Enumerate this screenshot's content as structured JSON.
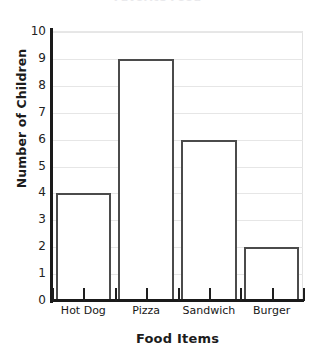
{
  "chart_data": {
    "type": "bar",
    "title": "Favorite Food",
    "xlabel": "Food Items",
    "ylabel": "Number of Children",
    "categories": [
      "Hot Dog",
      "Pizza",
      "Sandwich",
      "Burger"
    ],
    "values": [
      4,
      9,
      6,
      2
    ],
    "ylim": [
      0,
      10
    ],
    "ytick_labels": [
      "10",
      "9",
      "8",
      "7",
      "6",
      "5",
      "4",
      "3",
      "2",
      "1",
      "0"
    ],
    "ytick_values": [
      10,
      9,
      8,
      7,
      6,
      5,
      4,
      3,
      2,
      1,
      0
    ],
    "grid": true,
    "legend": "none",
    "orientation": "vertical",
    "bar_fill": "#ffffff",
    "bar_outline": "#4b4b4b",
    "gridline_color": "#e6e6e6",
    "axis_color": "#1a1a1a"
  }
}
